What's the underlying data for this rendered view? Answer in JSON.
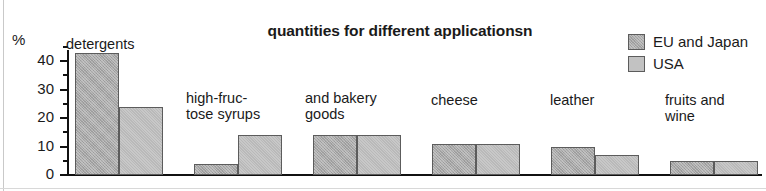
{
  "chart_data": {
    "type": "bar",
    "title": "quantities for different applicationsn",
    "xlabel": "",
    "ylabel": "%",
    "ylim": [
      0,
      46
    ],
    "grid": false,
    "legend_position": "top-right",
    "yticks_major": [
      0,
      10,
      20,
      30,
      40
    ],
    "yticks_minor": [
      5,
      15,
      25,
      35,
      45
    ],
    "ytick_labels": [
      "0",
      "10",
      "20",
      "30",
      "40"
    ],
    "categories": [
      "detergents",
      "high-fruc-\ntose syrups",
      "and bakery\ngoods",
      "cheese",
      "leather",
      "fruits and\nwine",
      "starch\nhydrolysis"
    ],
    "series": [
      {
        "name": "EU and Japan",
        "color": "#a8a8a8",
        "values": [
          43,
          4,
          14,
          11,
          10,
          5,
          3.5
        ]
      },
      {
        "name": "USA",
        "color": "#bdbdbd",
        "values": [
          24,
          14,
          14,
          11,
          7,
          5,
          5
        ]
      }
    ]
  },
  "legend": {
    "items": [
      {
        "label": "EU and Japan"
      },
      {
        "label": "USA"
      }
    ]
  }
}
